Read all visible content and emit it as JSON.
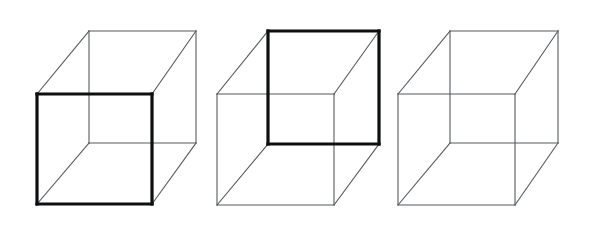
{
  "figure": {
    "background_color": "#ffffff",
    "width": 597,
    "height": 231,
    "thin_line_color": "#555b5e",
    "bold_line_color": "#0d0f10",
    "thin_line_width": 1.1,
    "bold_line_width": 3.2,
    "cube_count": 3
  },
  "cubes": [
    {
      "id": "cube-left",
      "label": "left-cube",
      "emphasis": "front-face-bold",
      "emphasis_description": "Lower-left square drawn with heavy stroke so it reads as the near face",
      "front_square": {
        "x1": 37,
        "y1": 94,
        "x2": 152,
        "y2": 204,
        "bold": true
      },
      "back_square": {
        "x1": 89,
        "y1": 31,
        "x2": 196,
        "y2": 143,
        "bold": false
      },
      "connector_edges": [
        {
          "from": "front-top-left",
          "to": "back-top-left"
        },
        {
          "from": "front-top-right",
          "to": "back-top-right"
        },
        {
          "from": "front-bottom-left",
          "to": "back-bottom-left"
        },
        {
          "from": "front-bottom-right",
          "to": "back-bottom-right"
        }
      ]
    },
    {
      "id": "cube-middle",
      "label": "middle-cube",
      "emphasis": "back-face-bold",
      "emphasis_description": "Upper-right square drawn with heavy stroke so it reads as the near face",
      "front_square": {
        "x1": 217,
        "y1": 94,
        "x2": 334,
        "y2": 205,
        "bold": false
      },
      "back_square": {
        "x1": 268,
        "y1": 31,
        "x2": 379,
        "y2": 144,
        "bold": true
      },
      "connector_edges": [
        {
          "from": "front-top-left",
          "to": "back-top-left"
        },
        {
          "from": "front-top-right",
          "to": "back-top-right"
        },
        {
          "from": "front-bottom-left",
          "to": "back-bottom-left"
        },
        {
          "from": "front-bottom-right",
          "to": "back-bottom-right"
        }
      ]
    },
    {
      "id": "cube-right",
      "label": "right-cube",
      "emphasis": "none",
      "emphasis_description": "All twelve edges drawn at uniform thin weight, fully ambiguous",
      "front_square": {
        "x1": 398,
        "y1": 94,
        "x2": 515,
        "y2": 205,
        "bold": false
      },
      "back_square": {
        "x1": 450,
        "y1": 31,
        "x2": 558,
        "y2": 143,
        "bold": false
      },
      "connector_edges": [
        {
          "from": "front-top-left",
          "to": "back-top-left"
        },
        {
          "from": "front-top-right",
          "to": "back-top-right"
        },
        {
          "from": "front-bottom-left",
          "to": "back-bottom-left"
        },
        {
          "from": "front-bottom-right",
          "to": "back-bottom-right"
        }
      ]
    }
  ]
}
